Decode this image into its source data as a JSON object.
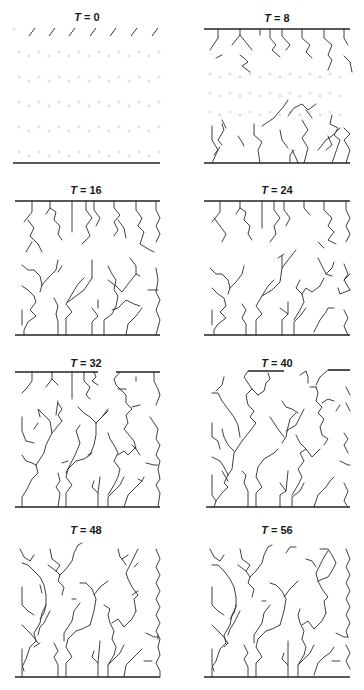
{
  "figure": {
    "panels": [
      {
        "id": "t0",
        "label_var": "T",
        "label_eq": " = 0",
        "time": 0
      },
      {
        "id": "t8",
        "label_var": "T",
        "label_eq": " = 8",
        "time": 8
      },
      {
        "id": "t16",
        "label_var": "T",
        "label_eq": " = 16",
        "time": 16
      },
      {
        "id": "t24",
        "label_var": "T",
        "label_eq": " = 24",
        "time": 24
      },
      {
        "id": "t32",
        "label_var": "T",
        "label_eq": " = 32",
        "time": 32
      },
      {
        "id": "t40",
        "label_var": "T",
        "label_eq": " = 40",
        "time": 40
      },
      {
        "id": "t48",
        "label_var": "T",
        "label_eq": " = 48",
        "time": 48
      },
      {
        "id": "t56",
        "label_var": "T",
        "label_eq": " = 56",
        "time": 56
      }
    ]
  }
}
